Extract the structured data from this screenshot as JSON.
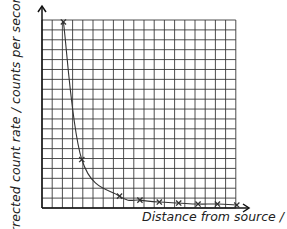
{
  "chart_data": {
    "type": "line",
    "title": "",
    "xlabel": "Distance from source / m",
    "ylabel": "Corrected count rate / counts per second",
    "grid": true,
    "grid_columns": 19,
    "grid_rows": 19,
    "xlim": [
      0,
      19.5
    ],
    "ylim": [
      0,
      19
    ],
    "axis_ticks_labeled": false,
    "legend": null,
    "markers": "x",
    "curve": "smooth inverse-square decay through points",
    "series": [
      {
        "name": "Corrected count rate",
        "x": [
          2.1,
          3.9,
          7.6,
          9.6,
          11.5,
          13.4,
          15.3,
          17.2,
          19.1
        ],
        "y": [
          18.8,
          4.9,
          1.2,
          0.8,
          0.6,
          0.5,
          0.4,
          0.4,
          0.3
        ]
      }
    ]
  },
  "colors": {
    "grid": "#3a3a3a",
    "curve": "#333333",
    "marker": "#333333",
    "text": "#222222",
    "background": "#ffffff"
  }
}
